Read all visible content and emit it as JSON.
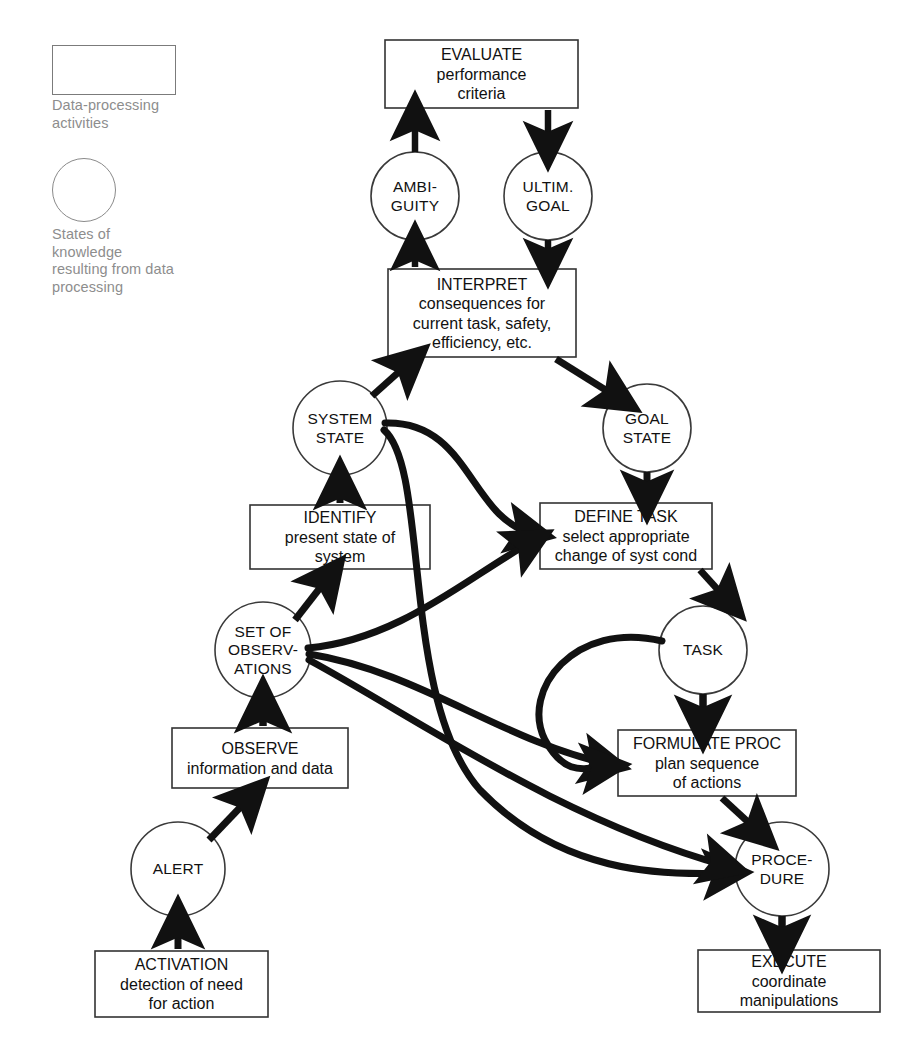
{
  "diagram": {
    "stroke_color": "#111111",
    "legend_color": "#8d8d8d",
    "background": "#ffffff"
  },
  "legend": {
    "box_shape_name": "rectangle",
    "box_caption": "Data-processing\nactivities",
    "circle_shape_name": "circle",
    "circle_caption": "States of\nknowledge\nresulting from data\nprocessing"
  },
  "nodes": {
    "boxes": [
      {
        "id": "evaluate",
        "title": "EVALUATE",
        "lines": "performance\ncriteria",
        "x": 385,
        "y": 40,
        "w": 193,
        "h": 68
      },
      {
        "id": "interpret",
        "title": "INTERPRET",
        "lines": "consequences for\ncurrent task, safety,\nefficiency, etc.",
        "x": 388,
        "y": 269,
        "w": 188,
        "h": 88
      },
      {
        "id": "identify",
        "title": "IDENTIFY",
        "lines": "present state of\nsystem",
        "x": 250,
        "y": 505,
        "w": 180,
        "h": 64
      },
      {
        "id": "define",
        "title": "DEFINE TASK",
        "lines": "select appropriate\nchange of syst cond",
        "x": 540,
        "y": 503,
        "w": 172,
        "h": 66
      },
      {
        "id": "observe",
        "title": "OBSERVE",
        "lines": "information and data",
        "x": 172,
        "y": 728,
        "w": 176,
        "h": 60
      },
      {
        "id": "formulate",
        "title": "FORMULATE PROC",
        "lines": "plan sequence\nof actions",
        "x": 618,
        "y": 730,
        "w": 178,
        "h": 66
      },
      {
        "id": "activation",
        "title": "ACTIVATION",
        "lines": "detection of need\nfor action",
        "x": 95,
        "y": 951,
        "w": 173,
        "h": 66
      },
      {
        "id": "execute",
        "title": "EXECUTE",
        "lines": "coordinate\nmanipulations",
        "x": 698,
        "y": 950,
        "w": 182,
        "h": 62
      }
    ],
    "circles": [
      {
        "id": "ambiguity",
        "label": "AMBI-\nGUITY",
        "cx": 415,
        "cy": 196,
        "r": 44
      },
      {
        "id": "ultimgoal",
        "label": "ULTIM.\nGOAL",
        "cx": 548,
        "cy": 196,
        "r": 44
      },
      {
        "id": "systemstate",
        "label": "SYSTEM\nSTATE",
        "cx": 340,
        "cy": 428,
        "r": 47
      },
      {
        "id": "goalstate",
        "label": "GOAL\nSTATE",
        "cx": 647,
        "cy": 428,
        "r": 44
      },
      {
        "id": "setofobs",
        "label": "SET OF\nOBSERV-\nATIONS",
        "cx": 263,
        "cy": 650,
        "r": 48
      },
      {
        "id": "task",
        "label": "TASK",
        "cx": 703,
        "cy": 650,
        "r": 44
      },
      {
        "id": "alert",
        "label": "ALERT",
        "cx": 178,
        "cy": 869,
        "r": 47
      },
      {
        "id": "procedure",
        "label": "PROCE-\nDURE",
        "cx": 782,
        "cy": 869,
        "r": 47
      }
    ]
  },
  "edges": [
    {
      "from": "ambiguity",
      "to": "evaluate",
      "kind": "straight-up"
    },
    {
      "from": "evaluate",
      "to": "ultimgoal",
      "kind": "straight-down"
    },
    {
      "from": "interpret",
      "to": "ambiguity",
      "kind": "straight-up"
    },
    {
      "from": "ultimgoal",
      "to": "interpret",
      "kind": "straight-down"
    },
    {
      "from": "systemstate",
      "to": "interpret",
      "kind": "diagonal-up"
    },
    {
      "from": "interpret",
      "to": "goalstate",
      "kind": "diagonal-down"
    },
    {
      "from": "identify",
      "to": "systemstate",
      "kind": "straight-up"
    },
    {
      "from": "goalstate",
      "to": "define",
      "kind": "straight-down"
    },
    {
      "from": "setofobs",
      "to": "identify",
      "kind": "diagonal-up"
    },
    {
      "from": "observe",
      "to": "setofobs",
      "kind": "straight-up"
    },
    {
      "from": "alert",
      "to": "observe",
      "kind": "diagonal-up"
    },
    {
      "from": "activation",
      "to": "alert",
      "kind": "straight-up"
    },
    {
      "from": "define",
      "to": "task",
      "kind": "diagonal-down"
    },
    {
      "from": "task",
      "to": "formulate",
      "kind": "straight-down"
    },
    {
      "from": "formulate",
      "to": "procedure",
      "kind": "diagonal-down"
    },
    {
      "from": "procedure",
      "to": "execute",
      "kind": "straight-down"
    },
    {
      "from": "systemstate",
      "to": "define",
      "kind": "shortcut-curve"
    },
    {
      "from": "systemstate",
      "to": "procedure",
      "kind": "shortcut-curve"
    },
    {
      "from": "setofobs",
      "to": "define",
      "kind": "shortcut-curve"
    },
    {
      "from": "setofobs",
      "to": "formulate",
      "kind": "shortcut-curve"
    },
    {
      "from": "setofobs",
      "to": "procedure",
      "kind": "shortcut-curve"
    },
    {
      "from": "task",
      "to": "formulate",
      "kind": "shortcut-curve"
    }
  ]
}
